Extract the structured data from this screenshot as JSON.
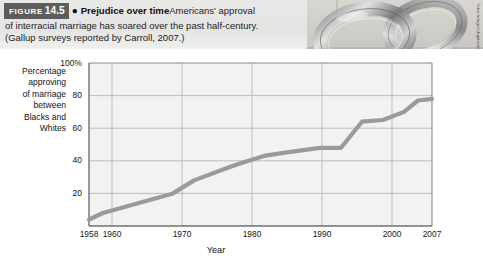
{
  "figure": {
    "badge_word": "FIGURE",
    "badge_number": "14.5",
    "bullet": "●",
    "title": "Prejudice over time",
    "caption_part1": "Americans' approval",
    "caption_line2": "of interracial marriage has soared over the past half-century.",
    "caption_line3": "(Gallup surveys reported by Carroll, 2007.)"
  },
  "photo": {
    "alt_name": "wedding-rings-photo",
    "credit": "Tetra Images/Jupiterimages"
  },
  "colors": {
    "badge_background": "#5d5d5d",
    "caption_background": "#e6e6e4",
    "line": "#9a9a9a",
    "grid": "#b7b7b7",
    "axis": "#6f6f6f",
    "plot_background": "#f2f2f0",
    "text": "#141414"
  },
  "chart_data": {
    "type": "line",
    "title": "Prejudice over time",
    "xlabel": "Year",
    "ylabel": "Percentage approving of marriage between Blacks and Whites",
    "ylabel_lines": [
      "Percentage",
      "approving",
      "of marriage",
      "between",
      "Blacks and",
      "Whites"
    ],
    "ylim": [
      0,
      100
    ],
    "xlim": [
      1958,
      2007
    ],
    "ytick_labels": [
      "100%",
      "80",
      "60",
      "40",
      "20"
    ],
    "ytick_values": [
      100,
      80,
      60,
      40,
      20
    ],
    "xtick_labels": [
      "1958",
      "1960",
      "1970",
      "1980",
      "1990",
      "2000",
      "2007"
    ],
    "xtick_values": [
      1958,
      1960,
      1970,
      1980,
      1990,
      2000,
      2007
    ],
    "grid": true,
    "legend": "none",
    "series": [
      {
        "name": "Approval of marriage between Blacks and Whites",
        "x": [
          1958,
          1960,
          1965,
          1970,
          1973,
          1978,
          1980,
          1983,
          1986,
          1991,
          1994,
          1997,
          2000,
          2003,
          2005,
          2007
        ],
        "values": [
          4,
          8,
          14,
          20,
          28,
          36,
          39,
          43,
          45,
          48,
          48,
          64,
          65,
          70,
          77,
          78
        ]
      }
    ]
  }
}
